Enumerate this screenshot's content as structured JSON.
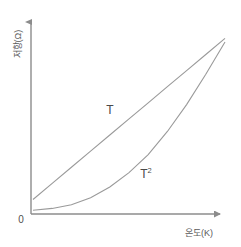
{
  "chart_data": {
    "type": "line",
    "title": "",
    "xlabel": "온도(K)",
    "ylabel": "저항(Ω)",
    "origin_label": "0",
    "xlim": [
      0,
      100
    ],
    "ylim": [
      0,
      100
    ],
    "grid": false,
    "legend_position": "inline-annotations",
    "axis_color": "#8c8c8c",
    "curve_color": "#9a9a9a",
    "background_color": "#ffffff",
    "series": [
      {
        "name": "T",
        "label": "T",
        "label_superscript": "",
        "relation": "linear",
        "description": "Resistance increases linearly with temperature",
        "x": [
          0,
          10,
          20,
          30,
          40,
          50,
          60,
          70,
          80,
          90,
          100
        ],
        "values": [
          7,
          16,
          25,
          34,
          43,
          52,
          61,
          70,
          79,
          88,
          97
        ]
      },
      {
        "name": "T2",
        "label": "T",
        "label_superscript": "2",
        "relation": "quadratic",
        "description": "Resistance increases with the square of temperature",
        "x": [
          0,
          10,
          20,
          30,
          40,
          50,
          60,
          70,
          80,
          90,
          100
        ],
        "values": [
          1,
          2,
          4,
          8,
          14,
          22,
          32,
          45,
          60,
          77,
          95
        ]
      }
    ],
    "annotations": [
      {
        "text": "T",
        "superscript": "",
        "x_px": 110,
        "y_px": 114
      },
      {
        "text": "T",
        "superscript": "2",
        "x_px": 146,
        "y_px": 178
      }
    ]
  },
  "axes": {
    "y_arrow_name": "y-axis-arrow",
    "x_arrow_name": "x-axis-arrow"
  }
}
